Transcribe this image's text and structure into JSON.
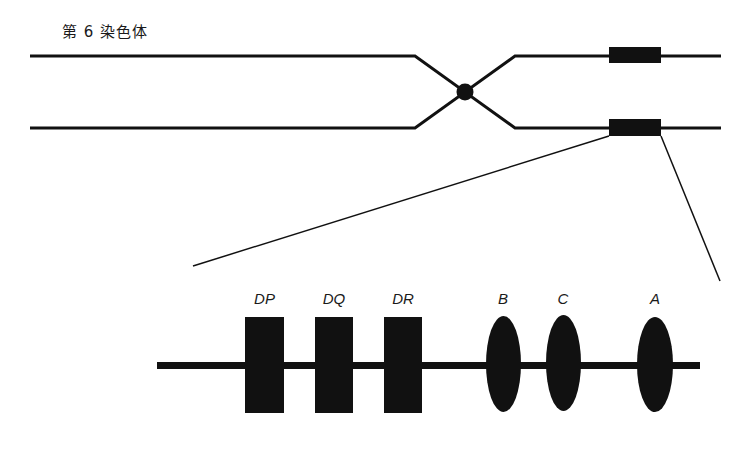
{
  "title": "第 6 染色体",
  "colors": {
    "ink": "#111111",
    "background": "#ffffff"
  },
  "chromosome": {
    "structure": "two sister chromatids joined at a centromere, with a highlighted band region on each chromatid"
  },
  "genes": {
    "class_II": [
      {
        "label": "DP",
        "shape": "rectangle"
      },
      {
        "label": "DQ",
        "shape": "rectangle"
      },
      {
        "label": "DR",
        "shape": "rectangle"
      }
    ],
    "class_I": [
      {
        "label": "B",
        "shape": "ellipse"
      },
      {
        "label": "C",
        "shape": "ellipse"
      },
      {
        "label": "A",
        "shape": "ellipse"
      }
    ]
  }
}
